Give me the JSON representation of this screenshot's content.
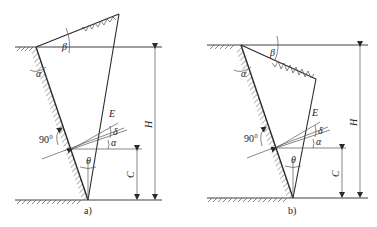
{
  "figure": {
    "panels": [
      {
        "id": "a",
        "caption": "a)",
        "labels": {
          "beta": "β",
          "alpha_wall": "α",
          "E": "E",
          "delta": "δ",
          "alpha": "α",
          "right_angle": "90°",
          "theta": "θ",
          "C": "C",
          "H": "H"
        },
        "backfill_slope": "upward"
      },
      {
        "id": "b",
        "caption": "b)",
        "labels": {
          "beta": "β",
          "alpha_wall": "α",
          "E": "E",
          "delta": "δ",
          "alpha": "α",
          "right_angle": "90°",
          "theta": "θ",
          "C": "C",
          "H": "H"
        },
        "backfill_slope": "downward"
      }
    ],
    "colors": {
      "line": "#2a2a2a",
      "background": "#ffffff"
    }
  }
}
